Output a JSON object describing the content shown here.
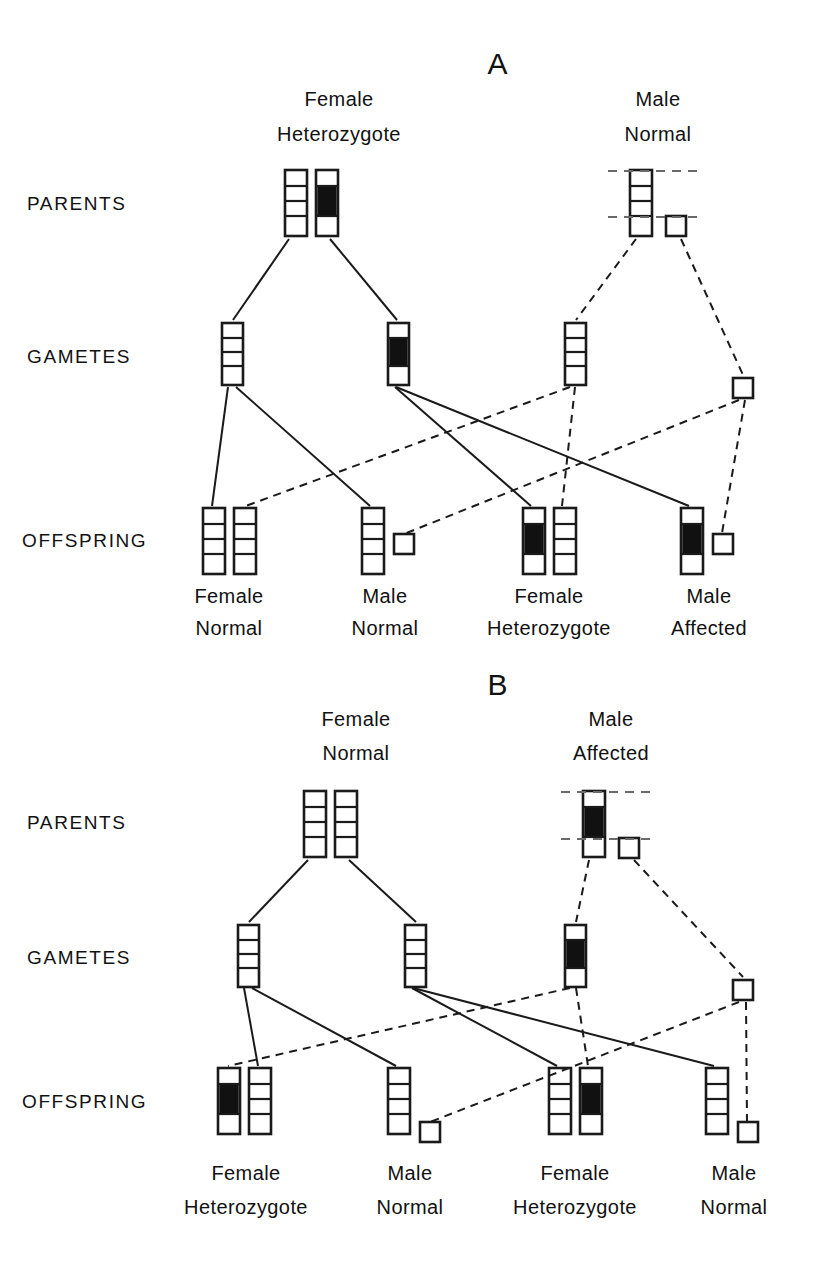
{
  "figure": {
    "title_a": "A",
    "title_b": "B",
    "stroke_color": "#1a1a1a",
    "band_color": "#111111",
    "background": "#ffffff"
  },
  "row_labels": {
    "parents": "PARENTS",
    "gametes": "GAMETES",
    "offspring": "OFFSPRING"
  },
  "panels": [
    {
      "id": "panel-a",
      "letter": "A",
      "parents": [
        {
          "sex": "Female",
          "status": "Heterozygote",
          "line1": "Female",
          "line2": "Heterozygote"
        },
        {
          "sex": "Male",
          "status": "Normal",
          "line1": "Male",
          "line2": "Normal"
        }
      ],
      "offspring": [
        {
          "line1": "Female",
          "line2": "Normal"
        },
        {
          "line1": "Male",
          "line2": "Normal"
        },
        {
          "line1": "Female",
          "line2": "Heterozygote"
        },
        {
          "line1": "Male",
          "line2": "Affected"
        }
      ]
    },
    {
      "id": "panel-b",
      "letter": "B",
      "parents": [
        {
          "sex": "Female",
          "status": "Normal",
          "line1": "Female",
          "line2": "Normal"
        },
        {
          "sex": "Male",
          "status": "Affected",
          "line1": "Male",
          "line2": "Affected"
        }
      ],
      "offspring": [
        {
          "line1": "Female",
          "line2": "Heterozygote"
        },
        {
          "line1": "Male",
          "line2": "Normal"
        },
        {
          "line1": "Female",
          "line2": "Heterozygote"
        },
        {
          "line1": "Male",
          "line2": "Normal"
        }
      ]
    }
  ],
  "legend_semantics": {
    "x_chromosome": "tall-bar-with-three-dividers",
    "y_chromosome": "small-square",
    "mutant_band": "solid-black-band-in-second-segment",
    "maternal_line_style": "solid",
    "paternal_line_style": "dashed"
  }
}
